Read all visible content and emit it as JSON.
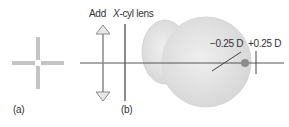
{
  "panels": {
    "a": {
      "label": "(a)"
    },
    "b": {
      "label": "(b)",
      "add_label": "Add",
      "xcyl_prefix": "X",
      "xcyl_rest": "-cyl lens",
      "minus_label": "−0.25 D",
      "plus_label": "+0.25 D"
    }
  },
  "colors": {
    "line": "#555555",
    "cross": "#bdbdbd",
    "eye_fill": "#e2e2e2",
    "eye_stroke": "#cccccc",
    "focal_dot": "#8a8a8a",
    "arrow": "#9a9a9a"
  }
}
